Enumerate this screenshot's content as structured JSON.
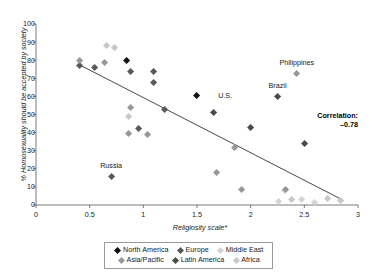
{
  "chart_data": {
    "type": "scatter",
    "title": "",
    "xlabel": "Religiosity scale*",
    "ylabel": "% Homosexuality should be accepted by society",
    "xlim": [
      0,
      3
    ],
    "ylim": [
      0,
      100
    ],
    "xticks": [
      "0",
      "0.5",
      "1",
      "1.5",
      "2",
      "2.5",
      "3"
    ],
    "xtick_values": [
      0,
      0.5,
      1,
      1.5,
      2,
      2.5,
      3
    ],
    "yticks": [
      "0",
      "10",
      "20",
      "30",
      "40",
      "50",
      "60",
      "70",
      "80",
      "90",
      "100"
    ],
    "ytick_values": [
      0,
      10,
      20,
      30,
      40,
      50,
      60,
      70,
      80,
      90,
      100
    ],
    "grid": false,
    "legend_position": "bottom",
    "annotations": [
      {
        "text": "Philippines",
        "x": 2.43,
        "y": 78.5,
        "anchor": "center"
      },
      {
        "text": "Brazil",
        "x": 2.25,
        "y": 65.5,
        "anchor": "center"
      },
      {
        "text": "U.S.",
        "x": 1.66,
        "y": 60.0,
        "anchor": "left"
      },
      {
        "text": "Russia",
        "x": 0.7,
        "y": 21.5,
        "anchor": "center"
      }
    ],
    "correlation_label": "Correlation:",
    "correlation_value": "–0.78",
    "trendline": {
      "x0": 0.42,
      "y0": 77.0,
      "x1": 2.85,
      "y1": 3.0,
      "color": "#333333"
    },
    "series": [
      {
        "name": "North America",
        "color": "#111111",
        "points": [
          {
            "x": 0.84,
            "y": 80.0
          },
          {
            "x": 1.5,
            "y": 60.3
          }
        ]
      },
      {
        "name": "Europe",
        "color": "#595959",
        "points": [
          {
            "x": 0.41,
            "y": 76.8
          },
          {
            "x": 0.55,
            "y": 75.8
          },
          {
            "x": 0.88,
            "y": 73.8
          },
          {
            "x": 1.1,
            "y": 73.8
          },
          {
            "x": 1.1,
            "y": 67.8
          },
          {
            "x": 1.2,
            "y": 52.8
          },
          {
            "x": 0.96,
            "y": 42.0
          },
          {
            "x": 0.7,
            "y": 15.9
          }
        ]
      },
      {
        "name": "Middle East",
        "color": "#d4d4d4",
        "points": [
          {
            "x": 2.26,
            "y": 1.8
          },
          {
            "x": 2.47,
            "y": 3.2
          },
          {
            "x": 2.6,
            "y": 1.5
          },
          {
            "x": 2.32,
            "y": 8.2
          }
        ]
      },
      {
        "name": "Asia/Pacific",
        "color": "#989898",
        "points": [
          {
            "x": 0.41,
            "y": 80.0
          },
          {
            "x": 0.64,
            "y": 78.8
          },
          {
            "x": 0.88,
            "y": 54.0
          },
          {
            "x": 0.86,
            "y": 39.7
          },
          {
            "x": 1.04,
            "y": 39.0
          },
          {
            "x": 1.68,
            "y": 17.7
          },
          {
            "x": 1.92,
            "y": 8.7
          },
          {
            "x": 2.43,
            "y": 72.6
          },
          {
            "x": 2.33,
            "y": 8.6
          },
          {
            "x": 1.85,
            "y": 31.8
          }
        ]
      },
      {
        "name": "Latin America",
        "color": "#4a4a4a",
        "points": [
          {
            "x": 1.65,
            "y": 50.8
          },
          {
            "x": 2.0,
            "y": 42.7
          },
          {
            "x": 2.25,
            "y": 59.7
          },
          {
            "x": 2.5,
            "y": 34.0
          }
        ]
      },
      {
        "name": "Africa",
        "color": "#c8c8c8",
        "points": [
          {
            "x": 0.66,
            "y": 87.8
          },
          {
            "x": 0.73,
            "y": 86.8
          },
          {
            "x": 0.86,
            "y": 49.0
          },
          {
            "x": 2.72,
            "y": 3.4
          },
          {
            "x": 2.84,
            "y": 2.7
          },
          {
            "x": 2.38,
            "y": 3.0
          }
        ]
      }
    ]
  },
  "legend": {
    "items": [
      {
        "label": "North America",
        "color": "#111111"
      },
      {
        "label": "Europe",
        "color": "#595959"
      },
      {
        "label": "Middle East",
        "color": "#d4d4d4"
      },
      {
        "label": "Asia/Pacific",
        "color": "#989898"
      },
      {
        "label": "Latin America",
        "color": "#4a4a4a"
      },
      {
        "label": "Africa",
        "color": "#c8c8c8"
      }
    ]
  }
}
